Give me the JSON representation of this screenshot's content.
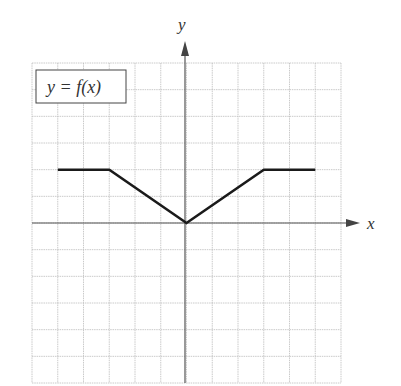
{
  "chart_data": {
    "type": "line",
    "title": "y = f(x)",
    "xlabel": "x",
    "ylabel": "y",
    "xlim": [
      -6,
      6
    ],
    "ylim": [
      -6,
      6
    ],
    "grid": true,
    "tick_labels": false,
    "legend": {
      "text": "y = f(x)",
      "position": "top-left"
    },
    "series": [
      {
        "name": "f(x)",
        "x": [
          -5,
          -3,
          0,
          3,
          5
        ],
        "y": [
          2,
          2,
          0,
          2,
          2
        ]
      }
    ]
  },
  "labels": {
    "legend": "y = f(x)",
    "x_axis": "x",
    "y_axis": "y"
  },
  "colors": {
    "grid": "#bdbdbd",
    "axis": "#555555",
    "curve": "#1a1a1a"
  }
}
